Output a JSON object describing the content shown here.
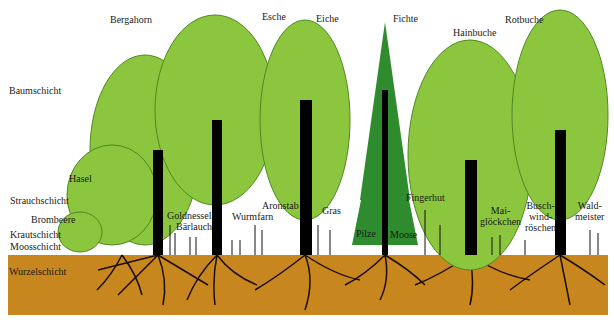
{
  "colors": {
    "background": "#ffffff",
    "canopy_light": "#8cc63f",
    "canopy_outline": "#4c8a1e",
    "conifer": "#2e8b2e",
    "trunk": "#000000",
    "soil": "#c8861e",
    "text": "#1a1a1a"
  },
  "layers": {
    "baumschicht": "Baumschicht",
    "strauchschicht": "Strauchschicht",
    "krautschicht": "Krautschicht",
    "moosschicht": "Moosschicht",
    "wurzelschicht": "Wurzelschicht"
  },
  "trees": {
    "bergahorn": "Bergahorn",
    "esche": "Esche",
    "eiche": "Eiche",
    "fichte": "Fichte",
    "hainbuche": "Hainbuche",
    "rotbuche": "Rotbuche"
  },
  "plants": {
    "hasel": "Hasel",
    "brombeere": "Brombeere",
    "goldnessel": "Goldnessel",
    "baerlauch": "Bärlauch",
    "wurmfarn": "Wurmfarn",
    "aronstab": "Aronstab",
    "gras": "Gras",
    "pilze": "Pilze",
    "moose": "Moose",
    "fingerhut": "Fingerhut",
    "maigloeckchen_1": "Mai-",
    "maigloeckchen_2": "glöckchen",
    "buschwindroeschen_1": "Busch-",
    "buschwindroeschen_2": "wind-",
    "buschwindroeschen_3": "röschen",
    "waldmeister_1": "Wald-",
    "waldmeister_2": "meister"
  }
}
